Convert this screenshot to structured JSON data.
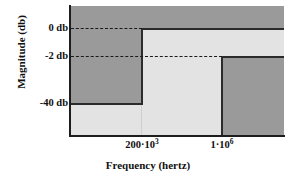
{
  "chart_data": {
    "type": "area",
    "title": "",
    "xlabel": "Frequency (hertz)",
    "ylabel": "Magnitude (db)",
    "x_tick_labels": [
      "200·10",
      "1·10"
    ],
    "x_tick_exponents": [
      "3",
      "6"
    ],
    "x_tick_values": [
      200000,
      1000000
    ],
    "y_tick_labels": [
      "0 db",
      "-2 db",
      "-40 db"
    ],
    "y_tick_values": [
      0,
      -2,
      -40
    ],
    "ylim": [
      -48,
      5
    ],
    "xlim": [
      0,
      2000000
    ],
    "grid": false,
    "legend": false,
    "colors": {
      "forbidden_region": "#9a9a9a",
      "allowed_region": "#e3e3e3",
      "spec_line": "#2b2b2b",
      "guide_line": "#1a1a1a",
      "axis": "#1d1d1d",
      "background": "#ffffff"
    },
    "regions": [
      {
        "name": "stopband-low-forbidden",
        "x_range": [
          0,
          200000
        ],
        "y_range": [
          -40,
          5
        ],
        "fill": "#9a9a9a"
      },
      {
        "name": "above-passband-forbidden",
        "x_range": [
          200000,
          2000000
        ],
        "y_range": [
          0,
          5
        ],
        "fill": "#9a9a9a"
      },
      {
        "name": "stopband-high-forbidden",
        "x_range": [
          1000000,
          2000000
        ],
        "y_range": [
          -48,
          -2
        ],
        "fill": "#9a9a9a"
      }
    ],
    "guide_lines": [
      {
        "name": "0-db-guide",
        "y": 0,
        "style": "dashed"
      },
      {
        "name": "-2-db-guide",
        "y": -2,
        "style": "dashed"
      }
    ],
    "spec_boundary": [
      {
        "x": 0,
        "y": -40
      },
      {
        "x": 200000,
        "y": -40
      },
      {
        "x": 200000,
        "y": 0
      },
      {
        "x": 2000000,
        "y": 0
      },
      {
        "x": 1000000,
        "y": -2
      },
      {
        "x": 1000000,
        "y": -48
      }
    ]
  },
  "axes": {
    "y_title": "Magnitude (db)",
    "x_title": "Frequency (hertz)",
    "y_ticks": [
      {
        "label": "0 db"
      },
      {
        "label": "-2 db"
      },
      {
        "label": "-40 db"
      }
    ],
    "x_ticks": [
      {
        "mantissa": "200·10",
        "exponent": "3"
      },
      {
        "mantissa": "1·10",
        "exponent": "6"
      }
    ]
  }
}
